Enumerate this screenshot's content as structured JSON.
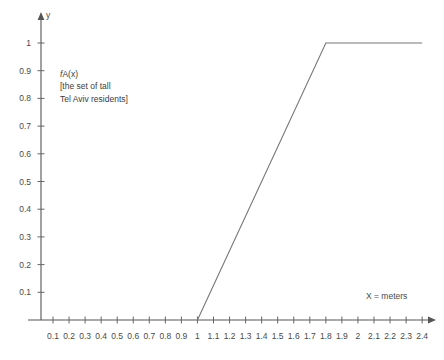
{
  "chart_data": {
    "type": "line",
    "title": "",
    "subtitle": "",
    "xlabel": "X = meters",
    "ylabel": "y",
    "grid": false,
    "legend": "none",
    "annotations": [
      {
        "name": "membership-function-label",
        "lines": [
          "fA(x)",
          "[the set of tall",
          "Tel Aviv residents]"
        ],
        "function_symbol": "f",
        "function_subscript": "A",
        "function_arg": "(x)",
        "x": 0.8,
        "y": 0.85
      }
    ],
    "xlim": [
      0,
      2.5
    ],
    "ylim": [
      0,
      1.08
    ],
    "x_ticks": [
      "0.1",
      "0.2",
      "0.3",
      "0.4",
      "0.5",
      "0.6",
      "0.7",
      "0.8",
      "0.9",
      "1",
      "1.1",
      "1.2",
      "1.3",
      "1.4",
      "1.5",
      "1.6",
      "1.7",
      "1.8",
      "1.9",
      "2",
      "2.1",
      "2.2",
      "2.3",
      "2.4"
    ],
    "x_tick_values": [
      0.1,
      0.2,
      0.3,
      0.4,
      0.5,
      0.6,
      0.7,
      0.8,
      0.9,
      1.0,
      1.1,
      1.2,
      1.3,
      1.4,
      1.5,
      1.6,
      1.7,
      1.8,
      1.9,
      2.0,
      2.1,
      2.2,
      2.3,
      2.4
    ],
    "y_ticks": [
      "0.1",
      "0.2",
      "0.3",
      "0.4",
      "0.5",
      "0.6",
      "0.7",
      "0.8",
      "0.9",
      "1"
    ],
    "y_tick_values": [
      0.1,
      0.2,
      0.3,
      0.4,
      0.5,
      0.6,
      0.7,
      0.8,
      0.9,
      1.0
    ],
    "series": [
      {
        "name": "fA(x)",
        "color": "#777777",
        "x": [
          1.0,
          1.8,
          2.4
        ],
        "values": [
          0.0,
          1.0,
          1.0
        ],
        "breakpoints": [
          {
            "x": 1.0,
            "y": 0.0,
            "note": "ramp-start"
          },
          {
            "x": 1.8,
            "y": 1.0,
            "note": "plateau-start"
          },
          {
            "x": 2.4,
            "y": 1.0,
            "note": "plateau-end"
          }
        ]
      }
    ]
  },
  "colors": {
    "background": "#ffffff",
    "axis": "#555555",
    "line": "#777777",
    "text": "#444444"
  }
}
